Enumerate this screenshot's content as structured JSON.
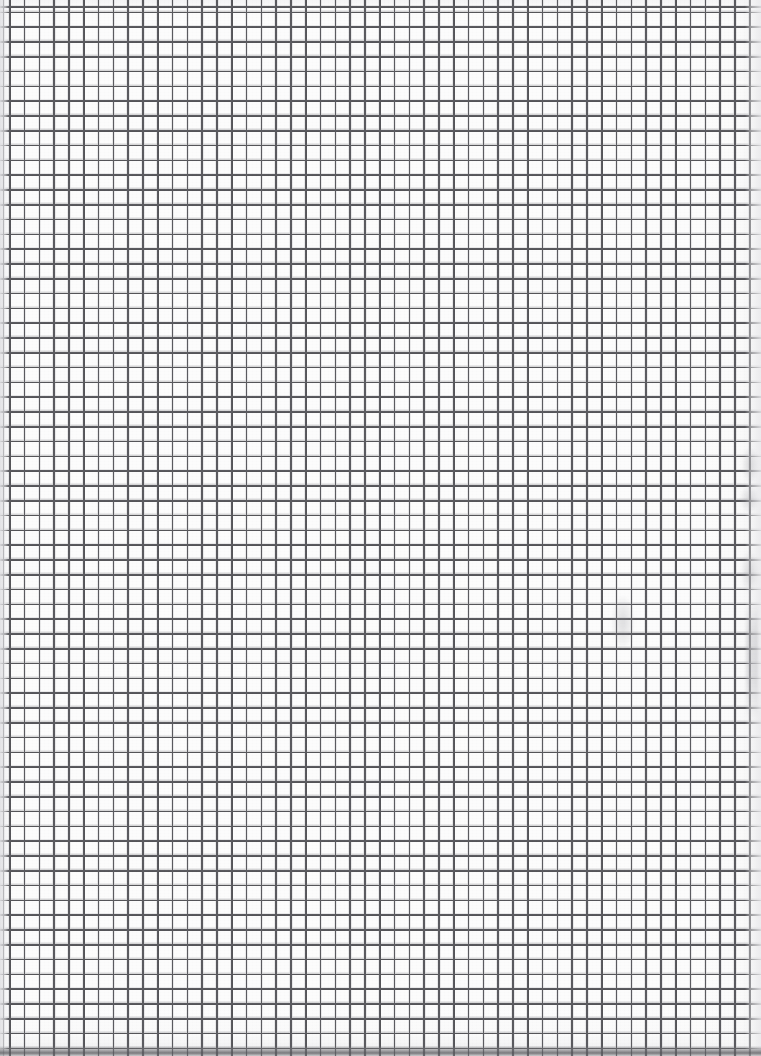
{
  "document": {
    "kind": "scanned-graph-paper",
    "title": "Blank squared graph paper sheet",
    "caption": "",
    "visible_text": "",
    "page_width_px": 761,
    "page_height_px": 1056
  },
  "paper": {
    "background_color": "#fcfcfc",
    "base_tint": "#fdfdfd",
    "edge_shadow_color": "#e4e4e6",
    "bottom_edge_color": "#5c5c60",
    "grain_opacity": 0.5
  },
  "grid": {
    "type": "square",
    "line_color": "#4e4e52",
    "line_color_soft": "#8a8a8f",
    "cell_size_px": 14.8,
    "line_width_px": 1.6,
    "origin_x_px": 9,
    "origin_y_px": 8,
    "columns": 50,
    "rows": 71,
    "first_vertical_line_x_px": 9,
    "last_vertical_line_x_px": 744,
    "first_horizontal_line_y_px": 8,
    "last_horizontal_line_y_px": 1046
  },
  "margins": {
    "left_margin_width_px": 9,
    "right_margin_start_px": 745,
    "right_margin_width_px": 16,
    "bottom_edge_start_px": 1046,
    "bottom_edge_height_px": 10
  },
  "artifacts": [
    {
      "name": "right-margin-smudge-upper",
      "x": 742,
      "y": 448,
      "width": 16,
      "height": 34
    },
    {
      "name": "right-margin-smudge-mid",
      "x": 740,
      "y": 486,
      "width": 18,
      "height": 26
    },
    {
      "name": "right-margin-smudge-lower",
      "x": 741,
      "y": 552,
      "width": 17,
      "height": 40
    },
    {
      "name": "center-right-faint-smudge",
      "x": 612,
      "y": 596,
      "width": 22,
      "height": 52
    },
    {
      "name": "right-margin-streak",
      "x": 746,
      "y": 600,
      "width": 12,
      "height": 120
    }
  ]
}
